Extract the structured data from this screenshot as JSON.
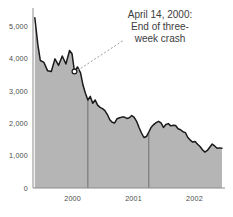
{
  "chart_data": {
    "type": "area",
    "title": "",
    "subtitle": "",
    "xlabel": "",
    "ylabel": "",
    "ylim": [
      0,
      5500
    ],
    "xlim": [
      1999.6,
      2002.75
    ],
    "grid": false,
    "legend": null,
    "fill_color": "#b5b5b5",
    "line_color": "#1a1a1a",
    "axis_color": "#8c8c8c",
    "text_color": "#3d3d3d",
    "background": "#ffffff",
    "y_ticks": [
      "0",
      "1,000",
      "2,000",
      "3,000",
      "4,000",
      "5,000"
    ],
    "y_tick_values": [
      0,
      1000,
      2000,
      3000,
      4000,
      5000
    ],
    "x_ticks": [
      "2000",
      "2001",
      "2002"
    ],
    "x_tick_values": [
      2000.25,
      2001.25,
      2002.25
    ],
    "year_dividers": [
      2000.5,
      2001.5
    ],
    "marker": {
      "label": "april-14-2000-point",
      "x": 2000.28,
      "y": 3600
    },
    "annotation": {
      "lines": [
        "April 14, 2000:",
        "End of three-",
        "week crash"
      ],
      "full_text": "April 14, 2000: End of three-week crash",
      "leader_style": "dotted"
    },
    "series": [
      {
        "name": "index",
        "x": [
          1999.63,
          1999.68,
          1999.72,
          1999.78,
          1999.84,
          1999.9,
          1999.96,
          2000.02,
          2000.08,
          2000.14,
          2000.2,
          2000.24,
          2000.28,
          2000.33,
          2000.38,
          2000.42,
          2000.46,
          2000.5,
          2000.54,
          2000.58,
          2000.62,
          2000.66,
          2000.7,
          2000.74,
          2000.78,
          2000.82,
          2000.86,
          2000.9,
          2000.94,
          2000.98,
          2001.02,
          2001.06,
          2001.1,
          2001.14,
          2001.18,
          2001.22,
          2001.26,
          2001.3,
          2001.34,
          2001.38,
          2001.42,
          2001.46,
          2001.5,
          2001.54,
          2001.58,
          2001.62,
          2001.66,
          2001.7,
          2001.74,
          2001.78,
          2001.82,
          2001.86,
          2001.9,
          2001.94,
          2001.98,
          2002.02,
          2002.06,
          2002.1,
          2002.14,
          2002.18,
          2002.22,
          2002.26,
          2002.3,
          2002.34,
          2002.38,
          2002.42,
          2002.46,
          2002.5,
          2002.54,
          2002.58,
          2002.62,
          2002.66,
          2002.7
        ],
        "values": [
          5260,
          4420,
          3940,
          3880,
          3620,
          3600,
          3990,
          3790,
          4080,
          3830,
          4250,
          4150,
          3600,
          3740,
          3560,
          3180,
          2930,
          2720,
          2830,
          2620,
          2720,
          2560,
          2490,
          2450,
          2390,
          2270,
          2110,
          2030,
          2010,
          2140,
          2170,
          2190,
          2190,
          2150,
          2170,
          2240,
          2180,
          2060,
          1870,
          1700,
          1560,
          1590,
          1730,
          1880,
          1960,
          2020,
          2060,
          2010,
          1870,
          1960,
          1990,
          1920,
          1940,
          1930,
          1830,
          1800,
          1740,
          1710,
          1560,
          1480,
          1420,
          1440,
          1350,
          1280,
          1180,
          1110,
          1160,
          1260,
          1360,
          1300,
          1230,
          1240,
          1230
        ]
      }
    ]
  }
}
